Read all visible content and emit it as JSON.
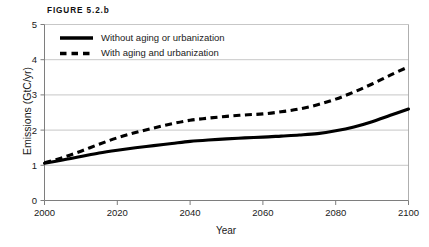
{
  "figure": {
    "label": "FIGURE 5.2.b"
  },
  "chart_data": {
    "type": "line",
    "title": "FIGURE 5.2.b",
    "xlabel": "Year",
    "ylabel": "Emissions (GtC/yr)",
    "xlim": [
      2000,
      2100
    ],
    "ylim": [
      0,
      5
    ],
    "xticks": [
      2000,
      2020,
      2040,
      2060,
      2080,
      2100
    ],
    "yticks": [
      0,
      1,
      2,
      3,
      4,
      5
    ],
    "xtick_labels": [
      "2000",
      "2020",
      "2040",
      "2060",
      "2080",
      "2100"
    ],
    "ytick_labels": [
      "0",
      "1",
      "2",
      "3",
      "4",
      "5"
    ],
    "grid": true,
    "grid_axis": "y",
    "legend_position": "top-left-inside",
    "x": [
      2000,
      2005,
      2010,
      2015,
      2020,
      2025,
      2030,
      2035,
      2040,
      2045,
      2050,
      2055,
      2060,
      2065,
      2070,
      2075,
      2080,
      2085,
      2090,
      2095,
      2100
    ],
    "series": [
      {
        "name": "Without aging or urbanization",
        "style": "solid",
        "color": "#000000",
        "values": [
          1.06,
          1.15,
          1.25,
          1.35,
          1.43,
          1.5,
          1.56,
          1.62,
          1.68,
          1.72,
          1.75,
          1.78,
          1.8,
          1.83,
          1.86,
          1.9,
          1.98,
          2.09,
          2.24,
          2.42,
          2.6
        ]
      },
      {
        "name": "With aging and urbanization",
        "style": "dashed",
        "color": "#000000",
        "values": [
          1.07,
          1.22,
          1.4,
          1.6,
          1.78,
          1.93,
          2.06,
          2.18,
          2.28,
          2.34,
          2.39,
          2.43,
          2.46,
          2.52,
          2.6,
          2.72,
          2.88,
          3.08,
          3.31,
          3.56,
          3.8
        ]
      }
    ],
    "legend": [
      {
        "label": "Without aging or urbanization",
        "style": "solid"
      },
      {
        "label": "With aging and urbanization",
        "style": "dashed"
      }
    ]
  }
}
